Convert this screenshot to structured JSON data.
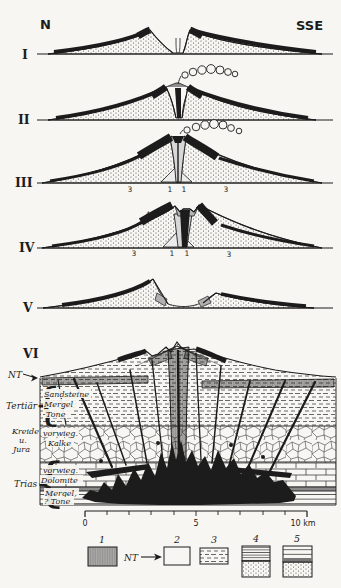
{
  "palette": {
    "paper": "#f7f6f2",
    "ink": "#1c1c1c",
    "flank_gray": "#8f8f8f",
    "block_gray": "#b5b5b5"
  },
  "compass": {
    "left": "N",
    "right": "SSE"
  },
  "stages": {
    "numerals": [
      "I",
      "II",
      "III",
      "IV",
      "V",
      "VI"
    ],
    "stage3_labels": [
      "4",
      "4",
      "3",
      "1",
      "1",
      "3"
    ],
    "stage4_labels": [
      "4",
      "4",
      "3",
      "1",
      "1",
      "3"
    ]
  },
  "section": {
    "nt_label": "NT",
    "brace": "{",
    "eras": [
      {
        "name": "Tertiär",
        "units": [
          "Sandsteine",
          "Mergel",
          "Tone"
        ]
      },
      {
        "name_lines": [
          "Kreide",
          "u.",
          "Jura"
        ],
        "units": [
          "vorwieg.",
          "Kalke"
        ]
      },
      {
        "name": "Trias",
        "units": [
          "vorwieg.",
          "Dolomite",
          "Mergel,",
          "? Tone"
        ]
      }
    ]
  },
  "scalebar": {
    "start": "0",
    "middle": "5",
    "end": "10 km"
  },
  "legend": {
    "nt_label": "NT",
    "items": [
      {
        "label": "1",
        "pattern": "vertical-hatch"
      },
      {
        "label": "2",
        "pattern": "blank"
      },
      {
        "label": "3",
        "pattern": "dashes"
      },
      {
        "label": "4",
        "pattern": "lines-over-stipple"
      },
      {
        "label": "5",
        "pattern": "layered-over-stipple"
      }
    ]
  }
}
